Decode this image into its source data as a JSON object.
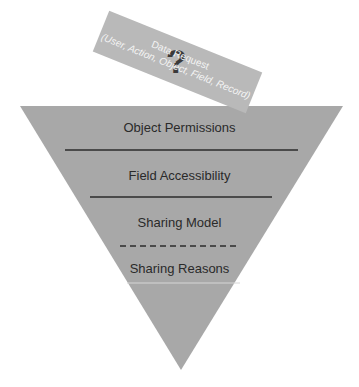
{
  "diagram": {
    "request_note": {
      "title": "Data Request",
      "subtitle": "(User, Action, Object, Field, Record)",
      "icon": "question-mark-icon",
      "icon_glyph": "?"
    },
    "funnel": {
      "layers": [
        {
          "label": "Object Permissions",
          "separator": "solid"
        },
        {
          "label": "Field Accessibility",
          "separator": "solid"
        },
        {
          "label": "Sharing Model",
          "separator": "dashed"
        },
        {
          "label": "Sharing Reasons",
          "separator": "thin-light"
        }
      ]
    },
    "colors": {
      "funnel_fill": "#a8a8a8",
      "note_fill": "#b9b9b9",
      "note_text": "#f4f4f4",
      "label_text": "#2a2a2a",
      "separator": "#2b2b2b"
    }
  }
}
